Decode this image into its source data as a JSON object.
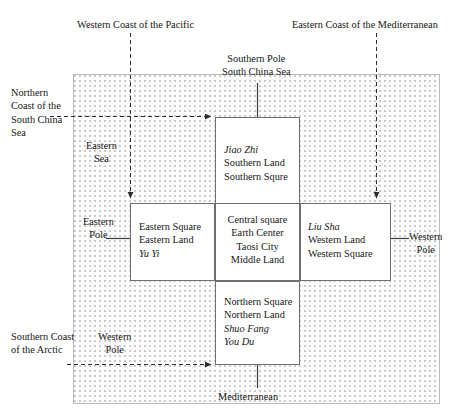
{
  "diagram": {
    "field": {
      "fill_color": "#ffffff",
      "dot_color": "#c9c9cf",
      "border_color": "#b9b9bf"
    },
    "line_color": "#3a3a3a"
  },
  "cells": {
    "south": {
      "name": "southern-square",
      "lines": [
        {
          "text": "Jiao Zhi",
          "italic": true
        },
        {
          "text": "Southern Land",
          "italic": false
        },
        {
          "text": "Southern Squre",
          "italic": false
        }
      ],
      "l0": "Jiao Zhi",
      "l1": "Southern Land",
      "l2": "Southern Squre"
    },
    "east": {
      "name": "eastern-square",
      "l0": "Eastern Square",
      "l1": "Eastern Land",
      "l2": "Yu Yi"
    },
    "center": {
      "name": "central-square",
      "l0": "Central square",
      "l1": "Earth Center",
      "l2": "Taosi City",
      "l3": "Middle Land"
    },
    "west": {
      "name": "western-square",
      "l0": "Liu Sha",
      "l1": "Western Land",
      "l2": "Western Square"
    },
    "north": {
      "name": "northern-square",
      "l0": "Northern Square",
      "l1": "Northern Land",
      "l2": "Shuo Fang",
      "l3": "You Du"
    }
  },
  "labels": {
    "pacific_coast": "Western Coast of the Pacific",
    "mediterranean_coast": "Eastern Coast of the Mediterranean",
    "southern_pole_l0": "Southern Pole",
    "southern_pole_l1": "South China Sea",
    "north_coast_scs": "Northern Coast of the South China Sea",
    "eastern_sea_l0": "Eastern",
    "eastern_sea_l1": "Sea",
    "eastern_pole_l0": "Eastern",
    "eastern_pole_l1": "Pole",
    "western_pole_right_l0": "Western",
    "western_pole_right_l1": "Pole",
    "southern_coast_arctic": "Southern Coast of the Arctic",
    "western_pole_left_l0": "Western",
    "western_pole_left_l1": "Pole",
    "mediterranean_bottom": "Mediterranean"
  }
}
